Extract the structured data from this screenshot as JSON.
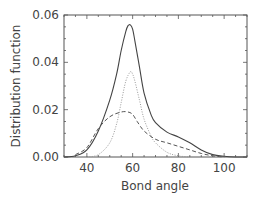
{
  "chart_data": {
    "type": "line",
    "title": "",
    "xlabel": "Bond angle",
    "ylabel": "Distribution function",
    "xlim": [
      30,
      110
    ],
    "ylim": [
      0,
      0.06
    ],
    "xticks": [
      "40",
      "60",
      "80",
      "100"
    ],
    "yticks": [
      "0.00",
      "0.02",
      "0.04",
      "0.06"
    ],
    "grid": false,
    "legend": null,
    "series": [
      {
        "name": "total",
        "style": "solid",
        "x": [
          30,
          35,
          40,
          45,
          50,
          53,
          55,
          57,
          58,
          59,
          60,
          61,
          63,
          65,
          68,
          70,
          75,
          80,
          85,
          90,
          95,
          100,
          105,
          110
        ],
        "y": [
          0,
          0.0005,
          0.003,
          0.011,
          0.024,
          0.035,
          0.045,
          0.053,
          0.0555,
          0.0558,
          0.054,
          0.049,
          0.038,
          0.027,
          0.018,
          0.0145,
          0.0105,
          0.0085,
          0.006,
          0.003,
          0.001,
          0.0003,
          0,
          0
        ]
      },
      {
        "name": "component 1",
        "style": "dotted",
        "x": [
          40,
          45,
          50,
          53,
          55,
          57,
          59,
          60,
          61,
          63,
          65,
          68,
          70,
          75,
          80,
          85
        ],
        "y": [
          0,
          0.001,
          0.006,
          0.014,
          0.023,
          0.032,
          0.036,
          0.035,
          0.032,
          0.024,
          0.016,
          0.009,
          0.006,
          0.002,
          0.0005,
          0
        ]
      },
      {
        "name": "component 2",
        "style": "dashed",
        "x": [
          35,
          40,
          45,
          50,
          55,
          58,
          60,
          62,
          65,
          70,
          75,
          80,
          85,
          90,
          95,
          100
        ],
        "y": [
          0.001,
          0.004,
          0.012,
          0.017,
          0.019,
          0.019,
          0.018,
          0.015,
          0.011,
          0.0075,
          0.006,
          0.0045,
          0.003,
          0.0015,
          0.0005,
          0
        ]
      }
    ]
  }
}
